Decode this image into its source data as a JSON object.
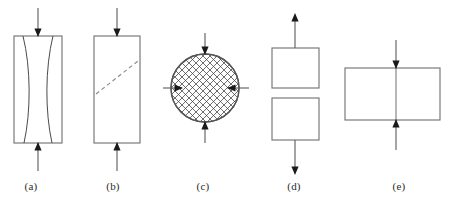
{
  "figure": {
    "background_color": "#ffffff",
    "outline_color": "#6e6e6e",
    "arrow_color": "#1a1a1a",
    "hatch_color": "#3f3f3f",
    "dash_color": "#8a8a8a",
    "label_color": "#2b2b2b",
    "width": 454,
    "height": 202
  },
  "panels": [
    {
      "id": "a",
      "label": "(a)",
      "label_x": 31,
      "label_y": 190,
      "shape": "tall-rectangle",
      "description": "axial compression with two inward bowing splitting curves",
      "loading": "compression",
      "arrow_directions": [
        "down-into-top",
        "up-into-bottom"
      ],
      "internal_feature": "two-curved-split-lines",
      "box": {
        "x": 14,
        "y": 36,
        "w": 48,
        "h": 107
      },
      "arrow_top": {
        "x": 38,
        "y_start": 8,
        "y_end": 36
      },
      "arrow_bottom": {
        "x": 38,
        "y_start": 171,
        "y_end": 143
      }
    },
    {
      "id": "b",
      "label": "(b)",
      "label_x": 113,
      "label_y": 190,
      "shape": "tall-rectangle",
      "description": "axial compression with inclined dashed shear plane",
      "loading": "compression",
      "arrow_directions": [
        "down-into-top",
        "up-into-bottom"
      ],
      "internal_feature": "dashed-diagonal-shear-line",
      "box": {
        "x": 94,
        "y": 36,
        "w": 46,
        "h": 107
      },
      "arrow_top": {
        "x": 117,
        "y_start": 8,
        "y_end": 36
      },
      "arrow_bottom": {
        "x": 117,
        "y_start": 171,
        "y_end": 143
      },
      "shear_line": {
        "x1": 96,
        "y1": 94,
        "x2": 138,
        "y2": 61
      }
    },
    {
      "id": "c",
      "label": "(c)",
      "label_x": 203,
      "label_y": 190,
      "shape": "hatched-circle",
      "description": "cross hatched circular specimen under all round inward loading",
      "loading": "triaxial-compression",
      "arrow_directions": [
        "down-into-top",
        "up-into-bottom",
        "right-into-left-side",
        "left-into-right-side"
      ],
      "internal_feature": "cross-hatch-fill",
      "circle": {
        "cx": 205,
        "cy": 88,
        "r": 34
      },
      "arrow_top": {
        "x": 205,
        "y_start": 33,
        "y_end": 54
      },
      "arrow_bottom": {
        "x": 205,
        "y_start": 143,
        "y_end": 122
      },
      "arrow_left": {
        "y": 88,
        "x_start": 163,
        "x_end": 182
      },
      "arrow_right": {
        "y": 88,
        "x_start": 249,
        "x_end": 228
      }
    },
    {
      "id": "d",
      "label": "(d)",
      "label_x": 294,
      "label_y": 190,
      "shape": "two-separated-squares",
      "description": "tensile separation into two detached blocks pulled apart",
      "loading": "tension",
      "arrow_directions": [
        "up-away-from-top",
        "down-away-from-bottom"
      ],
      "internal_feature": "separation-gap",
      "box_top": {
        "x": 272,
        "y": 48,
        "w": 47,
        "h": 40
      },
      "box_bottom": {
        "x": 272,
        "y": 98,
        "w": 47,
        "h": 42
      },
      "arrow_top": {
        "x": 295,
        "y_start": 48,
        "y_end": 14
      },
      "arrow_bottom": {
        "x": 295,
        "y_start": 140,
        "y_end": 174
      }
    },
    {
      "id": "e",
      "label": "(e)",
      "label_x": 399,
      "label_y": 190,
      "shape": "wide-rectangle",
      "description": "wide flat specimen under inward vertical loading with central line",
      "loading": "compression",
      "arrow_directions": [
        "down-into-top",
        "up-into-bottom"
      ],
      "internal_feature": "central-vertical-divider",
      "box": {
        "x": 345,
        "y": 68,
        "w": 95,
        "h": 52
      },
      "arrow_top": {
        "x": 396,
        "y_start": 40,
        "y_end": 68
      },
      "arrow_bottom": {
        "x": 396,
        "y_start": 150,
        "y_end": 120
      },
      "divider": {
        "x": 396,
        "y1": 68,
        "y2": 120
      }
    }
  ]
}
